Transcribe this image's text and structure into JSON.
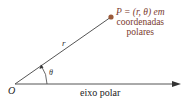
{
  "diagram": {
    "type": "polar-coordinates",
    "point_label_line1": "P = (r, θ) em",
    "point_label_line2": "coordenadas",
    "point_label_line3": "polares",
    "origin_label": "O",
    "radius_label": "r",
    "angle_label": "θ",
    "axis_label": "eixo polar",
    "colors": {
      "point": "#9a5a3a",
      "point_text": "#7a3a2e",
      "lines": "#444444"
    }
  }
}
